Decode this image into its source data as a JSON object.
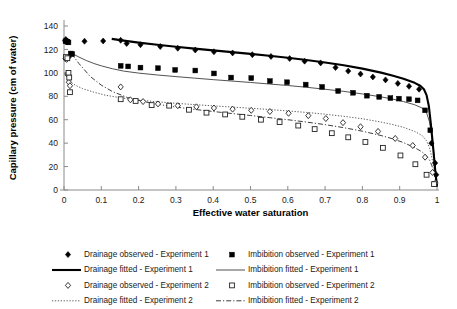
{
  "chart_data": {
    "type": "scatter",
    "title": "",
    "xlabel": "Effective water saturation",
    "ylabel": "Capillary pressure (cm of water)",
    "xlim": [
      0,
      1
    ],
    "ylim": [
      0,
      140
    ],
    "xticks": [
      "0",
      "0.1",
      "0.2",
      "0.3",
      "0.4",
      "0.5",
      "0.6",
      "0.7",
      "0.8",
      "0.9",
      "1"
    ],
    "yticks": [
      "0",
      "20",
      "40",
      "60",
      "80",
      "100",
      "120",
      "140"
    ],
    "grid": false,
    "legend_position": "bottom",
    "series": [
      {
        "name": "Drainage observed - Experiment 1",
        "marker": "filled-diamond",
        "style": "markers",
        "points": [
          [
            0.003,
            127.5
          ],
          [
            0.005,
            128.5
          ],
          [
            0.008,
            126.5
          ],
          [
            0.01,
            127.0
          ],
          [
            0.013,
            113.5
          ],
          [
            0.055,
            127.0
          ],
          [
            0.105,
            127.2
          ],
          [
            0.152,
            127.8
          ],
          [
            0.168,
            125.0
          ],
          [
            0.205,
            124.0
          ],
          [
            0.258,
            122.5
          ],
          [
            0.305,
            121.0
          ],
          [
            0.352,
            119.5
          ],
          [
            0.402,
            118.0
          ],
          [
            0.452,
            117.0
          ],
          [
            0.505,
            115.5
          ],
          [
            0.555,
            114.0
          ],
          [
            0.605,
            112.2
          ],
          [
            0.645,
            110.0
          ],
          [
            0.688,
            108.5
          ],
          [
            0.728,
            104.5
          ],
          [
            0.762,
            101.5
          ],
          [
            0.795,
            99.0
          ],
          [
            0.828,
            96.5
          ],
          [
            0.862,
            94.0
          ],
          [
            0.895,
            91.0
          ],
          [
            0.925,
            88.5
          ],
          [
            0.952,
            86.0
          ],
          [
            0.985,
            40.0
          ],
          [
            0.995,
            23.0
          ],
          [
            0.998,
            13.0
          ]
        ]
      },
      {
        "name": "Drainage fitted - Experiment 1",
        "marker": "none",
        "style": "thick-solid",
        "points": [
          [
            0.128,
            129.0
          ],
          [
            0.16,
            127.5
          ],
          [
            0.2,
            125.8
          ],
          [
            0.25,
            124.0
          ],
          [
            0.3,
            122.3
          ],
          [
            0.35,
            120.7
          ],
          [
            0.4,
            119.2
          ],
          [
            0.45,
            117.7
          ],
          [
            0.5,
            116.2
          ],
          [
            0.55,
            114.6
          ],
          [
            0.6,
            112.9
          ],
          [
            0.65,
            111.0
          ],
          [
            0.7,
            108.9
          ],
          [
            0.75,
            106.5
          ],
          [
            0.8,
            103.6
          ],
          [
            0.85,
            100.2
          ],
          [
            0.88,
            97.8
          ],
          [
            0.91,
            95.0
          ],
          [
            0.94,
            91.5
          ],
          [
            0.955,
            89.0
          ],
          [
            0.965,
            86.0
          ],
          [
            0.972,
            81.0
          ],
          [
            0.978,
            72.0
          ],
          [
            0.983,
            58.0
          ],
          [
            0.988,
            42.0
          ],
          [
            0.992,
            28.0
          ],
          [
            0.996,
            14.0
          ],
          [
            1.0,
            4.0
          ]
        ]
      },
      {
        "name": "Imbibition observed - Experiment 1",
        "marker": "filled-square",
        "style": "markers",
        "points": [
          [
            0.004,
            127.0
          ],
          [
            0.009,
            126.5
          ],
          [
            0.012,
            126.0
          ],
          [
            0.018,
            116.5
          ],
          [
            0.022,
            116.0
          ],
          [
            0.152,
            106.0
          ],
          [
            0.172,
            105.5
          ],
          [
            0.205,
            104.5
          ],
          [
            0.252,
            104.0
          ],
          [
            0.298,
            102.5
          ],
          [
            0.352,
            102.0
          ],
          [
            0.402,
            99.5
          ],
          [
            0.448,
            96.0
          ],
          [
            0.502,
            95.5
          ],
          [
            0.552,
            93.0
          ],
          [
            0.598,
            92.0
          ],
          [
            0.648,
            90.0
          ],
          [
            0.692,
            88.0
          ],
          [
            0.735,
            84.5
          ],
          [
            0.775,
            83.0
          ],
          [
            0.812,
            80.5
          ],
          [
            0.845,
            79.5
          ],
          [
            0.875,
            78.5
          ],
          [
            0.898,
            78.0
          ],
          [
            0.925,
            77.5
          ],
          [
            0.948,
            76.5
          ],
          [
            0.968,
            68.0
          ],
          [
            0.982,
            51.0
          ],
          [
            0.995,
            5.0
          ]
        ]
      },
      {
        "name": "Imbibition fitted - Experiment 1",
        "marker": "none",
        "style": "thin-solid",
        "points": [
          [
            0.022,
            116.5
          ],
          [
            0.04,
            113.5
          ],
          [
            0.06,
            110.5
          ],
          [
            0.08,
            108.0
          ],
          [
            0.1,
            106.0
          ],
          [
            0.13,
            103.5
          ],
          [
            0.16,
            101.5
          ],
          [
            0.2,
            99.8
          ],
          [
            0.25,
            98.2
          ],
          [
            0.3,
            96.8
          ],
          [
            0.35,
            95.5
          ],
          [
            0.4,
            94.2
          ],
          [
            0.45,
            93.0
          ],
          [
            0.5,
            91.8
          ],
          [
            0.55,
            90.5
          ],
          [
            0.6,
            89.2
          ],
          [
            0.65,
            87.7
          ],
          [
            0.7,
            86.0
          ],
          [
            0.75,
            84.2
          ],
          [
            0.8,
            82.0
          ],
          [
            0.85,
            79.5
          ],
          [
            0.88,
            77.7
          ],
          [
            0.91,
            75.5
          ],
          [
            0.94,
            72.8
          ],
          [
            0.96,
            70.0
          ],
          [
            0.972,
            66.0
          ],
          [
            0.98,
            58.0
          ],
          [
            0.986,
            46.0
          ],
          [
            0.991,
            33.0
          ],
          [
            0.995,
            20.0
          ],
          [
            1.0,
            4.0
          ]
        ]
      },
      {
        "name": "Drainage observed - Experiment 2",
        "marker": "open-diamond",
        "style": "markers",
        "points": [
          [
            0.004,
            112.0
          ],
          [
            0.007,
            111.5
          ],
          [
            0.009,
            99.0
          ],
          [
            0.011,
            98.0
          ],
          [
            0.013,
            92.0
          ],
          [
            0.016,
            89.0
          ],
          [
            0.152,
            88.0
          ],
          [
            0.178,
            77.0
          ],
          [
            0.212,
            75.5
          ],
          [
            0.252,
            73.5
          ],
          [
            0.305,
            72.0
          ],
          [
            0.355,
            71.0
          ],
          [
            0.402,
            70.0
          ],
          [
            0.452,
            69.0
          ],
          [
            0.502,
            68.0
          ],
          [
            0.552,
            67.0
          ],
          [
            0.602,
            65.5
          ],
          [
            0.655,
            63.5
          ],
          [
            0.702,
            61.0
          ],
          [
            0.748,
            57.5
          ],
          [
            0.795,
            54.0
          ],
          [
            0.842,
            50.0
          ],
          [
            0.888,
            44.0
          ],
          [
            0.935,
            38.0
          ],
          [
            0.968,
            28.0
          ],
          [
            0.988,
            15.0
          ],
          [
            0.996,
            6.0
          ]
        ]
      },
      {
        "name": "Drainage fitted - Experiment 2",
        "marker": "none",
        "style": "dotted",
        "points": [
          [
            0.014,
            93.0
          ],
          [
            0.03,
            89.5
          ],
          [
            0.05,
            86.5
          ],
          [
            0.08,
            83.5
          ],
          [
            0.11,
            81.0
          ],
          [
            0.15,
            78.8
          ],
          [
            0.2,
            76.8
          ],
          [
            0.25,
            75.3
          ],
          [
            0.3,
            74.0
          ],
          [
            0.35,
            72.9
          ],
          [
            0.4,
            71.8
          ],
          [
            0.45,
            70.8
          ],
          [
            0.5,
            69.8
          ],
          [
            0.55,
            68.7
          ],
          [
            0.6,
            67.5
          ],
          [
            0.65,
            66.2
          ],
          [
            0.7,
            64.7
          ],
          [
            0.75,
            62.9
          ],
          [
            0.8,
            60.8
          ],
          [
            0.85,
            58.0
          ],
          [
            0.88,
            56.0
          ],
          [
            0.91,
            53.5
          ],
          [
            0.94,
            50.0
          ],
          [
            0.96,
            46.5
          ],
          [
            0.972,
            42.0
          ],
          [
            0.98,
            36.0
          ],
          [
            0.986,
            28.0
          ],
          [
            0.991,
            20.0
          ],
          [
            0.995,
            12.0
          ],
          [
            1.0,
            3.0
          ]
        ]
      },
      {
        "name": "Imbibition observed - Experiment 2",
        "marker": "open-square",
        "style": "markers",
        "points": [
          [
            0.005,
            113.5
          ],
          [
            0.009,
            112.5
          ],
          [
            0.012,
            100.0
          ],
          [
            0.014,
            96.0
          ],
          [
            0.016,
            83.5
          ],
          [
            0.152,
            77.5
          ],
          [
            0.192,
            76.0
          ],
          [
            0.235,
            72.5
          ],
          [
            0.282,
            72.0
          ],
          [
            0.335,
            68.5
          ],
          [
            0.382,
            66.0
          ],
          [
            0.432,
            64.5
          ],
          [
            0.478,
            62.5
          ],
          [
            0.528,
            60.0
          ],
          [
            0.578,
            58.0
          ],
          [
            0.628,
            55.0
          ],
          [
            0.672,
            52.0
          ],
          [
            0.718,
            48.5
          ],
          [
            0.762,
            45.0
          ],
          [
            0.808,
            41.0
          ],
          [
            0.855,
            36.0
          ],
          [
            0.902,
            29.5
          ],
          [
            0.942,
            22.0
          ],
          [
            0.972,
            13.0
          ],
          [
            0.992,
            5.0
          ]
        ]
      },
      {
        "name": "Imbibition fitted - Experiment 2",
        "marker": "none",
        "style": "dash-dot",
        "points": [
          [
            0.02,
            116.5
          ],
          [
            0.04,
            108.0
          ],
          [
            0.07,
            97.0
          ],
          [
            0.1,
            89.5
          ],
          [
            0.13,
            84.0
          ],
          [
            0.17,
            79.0
          ],
          [
            0.21,
            75.8
          ],
          [
            0.25,
            73.2
          ],
          [
            0.3,
            70.8
          ],
          [
            0.35,
            68.8
          ],
          [
            0.4,
            67.0
          ],
          [
            0.45,
            65.3
          ],
          [
            0.5,
            63.6
          ],
          [
            0.55,
            61.8
          ],
          [
            0.6,
            60.0
          ],
          [
            0.65,
            58.0
          ],
          [
            0.7,
            55.8
          ],
          [
            0.75,
            53.2
          ],
          [
            0.8,
            50.2
          ],
          [
            0.85,
            46.5
          ],
          [
            0.88,
            43.8
          ],
          [
            0.91,
            40.5
          ],
          [
            0.94,
            36.2
          ],
          [
            0.96,
            32.5
          ],
          [
            0.972,
            29.0
          ],
          [
            0.98,
            25.5
          ],
          [
            0.986,
            21.0
          ],
          [
            0.991,
            15.5
          ],
          [
            0.995,
            10.0
          ],
          [
            1.0,
            2.5
          ]
        ]
      }
    ]
  },
  "legend": {
    "entries": [
      {
        "label": "Drainage observed - Experiment 1",
        "symbol": "filled-diamond"
      },
      {
        "label": "Imbibition observed - Experiment 1",
        "symbol": "filled-square"
      },
      {
        "label": "Drainage fitted - Experiment 1",
        "symbol": "thick-solid"
      },
      {
        "label": "Imbibition fitted - Experiment 1",
        "symbol": "thin-solid"
      },
      {
        "label": "Drainage observed - Experiment 2",
        "symbol": "open-diamond"
      },
      {
        "label": "Imbibition observed - Experiment 2",
        "symbol": "open-square"
      },
      {
        "label": "Drainage fitted - Experiment 2",
        "symbol": "dotted"
      },
      {
        "label": "Imbibition fitted - Experiment 2",
        "symbol": "dash-dot"
      }
    ]
  },
  "colors": {
    "axis": "#8a8a8a",
    "text": "#1a1a1a",
    "series": "#000000",
    "background": "#ffffff"
  }
}
